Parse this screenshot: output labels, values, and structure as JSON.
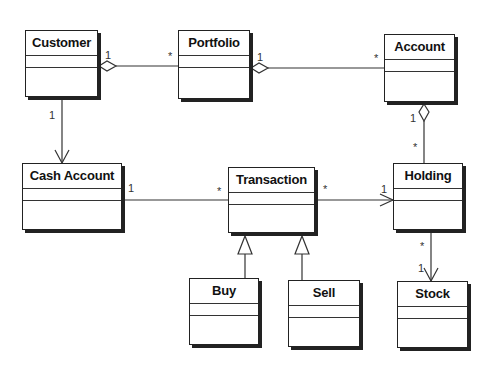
{
  "diagram": {
    "type": "UML class diagram",
    "classes": [
      {
        "id": "customer",
        "name": "Customer",
        "x": 25,
        "y": 30,
        "w": 73,
        "h": 67
      },
      {
        "id": "portfolio",
        "name": "Portfolio",
        "x": 178,
        "y": 30,
        "w": 72,
        "h": 69
      },
      {
        "id": "account",
        "name": "Account",
        "x": 384,
        "y": 34,
        "w": 71,
        "h": 68
      },
      {
        "id": "cash_account",
        "name": "Cash Account",
        "x": 22,
        "y": 163,
        "w": 100,
        "h": 67
      },
      {
        "id": "transaction",
        "name": "Transaction",
        "x": 228,
        "y": 167,
        "w": 87,
        "h": 66
      },
      {
        "id": "holding",
        "name": "Holding",
        "x": 393,
        "y": 163,
        "w": 70,
        "h": 67
      },
      {
        "id": "buy",
        "name": "Buy",
        "x": 189,
        "y": 278,
        "w": 70,
        "h": 67
      },
      {
        "id": "sell",
        "name": "Sell",
        "x": 288,
        "y": 280,
        "w": 72,
        "h": 67
      },
      {
        "id": "stock",
        "name": "Stock",
        "x": 397,
        "y": 281,
        "w": 71,
        "h": 67
      }
    ],
    "relationships": [
      {
        "from": "Customer",
        "to": "Portfolio",
        "kind": "aggregation",
        "from_mult": "1",
        "to_mult": "*"
      },
      {
        "from": "Portfolio",
        "to": "Account",
        "kind": "aggregation",
        "from_mult": "1",
        "to_mult": "*"
      },
      {
        "from": "Customer",
        "to": "Cash Account",
        "kind": "directed association",
        "from_mult": "",
        "to_mult": "1"
      },
      {
        "from": "Cash Account",
        "to": "Transaction",
        "kind": "association",
        "from_mult": "1",
        "to_mult": "*"
      },
      {
        "from": "Transaction",
        "to": "Holding",
        "kind": "directed association",
        "from_mult": "*",
        "to_mult": "1"
      },
      {
        "from": "Account",
        "to": "Holding",
        "kind": "aggregation",
        "from_mult": "1",
        "to_mult": "*"
      },
      {
        "from": "Holding",
        "to": "Stock",
        "kind": "directed association",
        "from_mult": "*",
        "to_mult": "1"
      },
      {
        "from": "Buy",
        "to": "Transaction",
        "kind": "generalization"
      },
      {
        "from": "Sell",
        "to": "Transaction",
        "kind": "generalization"
      }
    ],
    "labels": {
      "cust_portfolio_1": "1",
      "cust_portfolio_star": "*",
      "portfolio_account_1": "1",
      "portfolio_account_star": "*",
      "cust_cash_1": "1",
      "cash_trans_1": "1",
      "cash_trans_star": "*",
      "trans_hold_star": "*",
      "trans_hold_1": "1",
      "acct_hold_1": "1",
      "acct_hold_star": "*",
      "hold_stock_star": "*",
      "hold_stock_1": "1"
    }
  }
}
